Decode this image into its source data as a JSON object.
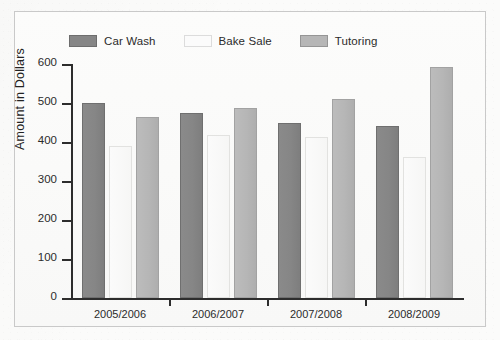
{
  "chart_data": {
    "type": "bar",
    "title": "",
    "subtitle": "",
    "xlabel": "",
    "ylabel": "Amount in Dollars",
    "ylim": [
      0,
      600
    ],
    "ytick_labels": [
      "600",
      "500",
      "400",
      "300",
      "200",
      "100",
      "0"
    ],
    "ytick_values": [
      600,
      500,
      400,
      300,
      200,
      100,
      0
    ],
    "grid": false,
    "legend_position": "top",
    "categories": [
      "2005/2006",
      "2006/2007",
      "2007/2008",
      "2008/2009"
    ],
    "series": [
      {
        "name": "Car Wash",
        "color": "#868686",
        "values": [
          500,
          475,
          450,
          440
        ]
      },
      {
        "name": "Bake Sale",
        "color": "#fafafa",
        "values": [
          390,
          418,
          412,
          362
        ]
      },
      {
        "name": "Tutoring",
        "color": "#b6b6b6",
        "values": [
          463,
          488,
          510,
          592
        ]
      }
    ]
  },
  "legend": {
    "items": [
      {
        "label": "Car Wash"
      },
      {
        "label": "Bake Sale"
      },
      {
        "label": "Tutoring"
      }
    ]
  },
  "axes": {
    "y_title": "Amount in Dollars",
    "y_ticks": [
      "600",
      "500",
      "400",
      "300",
      "200",
      "100",
      "0"
    ],
    "x_ticks": [
      "2005/2006",
      "2006/2007",
      "2007/2008",
      "2008/2009"
    ]
  },
  "colors": {
    "car_wash": "#868686",
    "bake_sale": "#fafafa",
    "tutoring": "#b6b6b6",
    "axis": "#2d2d2d",
    "frame": "#c9c9c9",
    "background": "#fbfbfa"
  }
}
